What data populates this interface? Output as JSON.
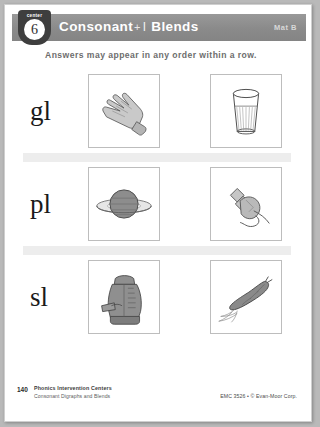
{
  "page": {
    "badge": {
      "word": "center",
      "number": "6"
    },
    "header": {
      "title_main": "Consonant",
      "title_plus": "+",
      "title_letter": "l",
      "title_tail": "Blends",
      "mat_label": "Mat B",
      "band_color": "#8e8e8e"
    },
    "directions": "Answers may appear in any order within a row.",
    "rows": [
      {
        "blend": "gl",
        "pictures": [
          {
            "name": "glove-picture",
            "word": "glove"
          },
          {
            "name": "glass-picture",
            "word": "glass"
          }
        ]
      },
      {
        "blend": "pl",
        "pictures": [
          {
            "name": "planet-picture",
            "word": "planet"
          },
          {
            "name": "plug-picture",
            "word": "plug"
          }
        ]
      },
      {
        "blend": "sl",
        "pictures": [
          {
            "name": "sleeping-bag-picture",
            "word": "sleeping bag"
          },
          {
            "name": "slug-picture",
            "word": "slug"
          }
        ]
      }
    ],
    "footer": {
      "page_number": "140",
      "book_title": "Phonics Intervention Centers",
      "book_subtitle": "Consonant Digraphs and Blends",
      "copyright": "EMC 3526 • © Evan-Moor Corp."
    }
  }
}
